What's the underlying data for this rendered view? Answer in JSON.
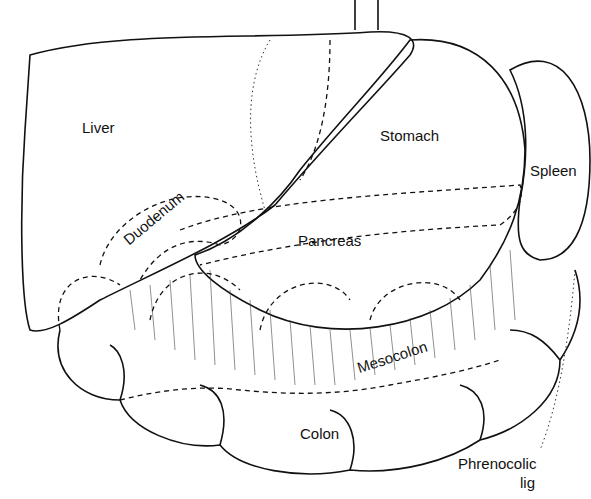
{
  "diagram": {
    "type": "anatomical illustration",
    "labels": {
      "liver": "Liver",
      "stomach": "Stomach",
      "spleen": "Spleen",
      "duodenum": "Duodenum",
      "pancreas": "Pancreas",
      "mesocolon": "Mesocolon",
      "colon": "Colon",
      "phrenocolic_1": "Phrenocolic",
      "phrenocolic_2": "lig"
    }
  }
}
